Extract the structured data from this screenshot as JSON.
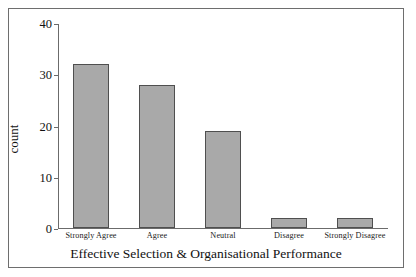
{
  "chart_data": {
    "type": "bar",
    "title": "",
    "subtitle": "",
    "categories": [
      "Strongly Agree",
      "Agree",
      "Neutral",
      "Disagree",
      "Strongly Disagree"
    ],
    "values": [
      32,
      28,
      19,
      2,
      2
    ],
    "xlabel": "Effective Selection & Organisational Performance",
    "ylabel": "count",
    "ylim": [
      0,
      40
    ],
    "yticks": [
      0,
      10,
      20,
      30,
      40
    ],
    "ytick_labels": [
      "0",
      "10",
      "20",
      "30",
      "40"
    ],
    "grid": false,
    "legend": false,
    "legend_position": "none",
    "bar_fill_color": "#a9a9a9",
    "bar_edge_color": "#4f4f4f",
    "axis_color": "#6b6b6b",
    "frame_color": "#6e6e6e",
    "background_color": "#ffffff"
  }
}
